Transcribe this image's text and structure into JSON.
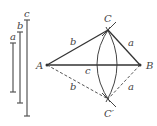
{
  "diagram": {
    "segments": [
      {
        "id": "a",
        "label": "a",
        "x": 13,
        "y1": 43,
        "y2": 92,
        "label_x": 10,
        "label_y": 40
      },
      {
        "id": "b",
        "label": "b",
        "x": 20,
        "y1": 32,
        "y2": 103,
        "label_x": 17,
        "label_y": 29
      },
      {
        "id": "c",
        "label": "c",
        "x": 27,
        "y1": 20,
        "y2": 116,
        "label_x": 24,
        "label_y": 17
      }
    ],
    "points": {
      "A": {
        "label": "A",
        "x": 47,
        "y": 65,
        "label_x": 36,
        "label_y": 69
      },
      "B": {
        "label": "B",
        "x": 140,
        "y": 65,
        "label_x": 146,
        "label_y": 69
      },
      "C": {
        "label": "C",
        "x": 108,
        "y": 30,
        "label_x": 104,
        "label_y": 22
      },
      "C_prime": {
        "label": "C′",
        "x": 108,
        "y": 99,
        "label_x": 104,
        "label_y": 117
      }
    },
    "edge_labels": {
      "AC": "b",
      "BC": "a",
      "AB": "c",
      "AC_prime": "b",
      "BC_prime": "a"
    },
    "colors": {
      "line": "#333333",
      "text": "#444444",
      "background": "#ffffff"
    }
  }
}
